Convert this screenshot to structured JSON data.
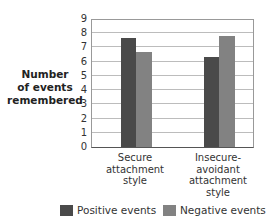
{
  "chart_data": {
    "type": "bar",
    "title": "",
    "xlabel": "",
    "ylabel": "Number of events remembered",
    "ylabel_lines": [
      "Number",
      "of events",
      "remembered"
    ],
    "ylim": [
      0,
      9
    ],
    "yticks": [
      "0",
      "1",
      "2",
      "3",
      "4",
      "5",
      "6",
      "7",
      "8",
      "9"
    ],
    "grid": true,
    "legend_position": "bottom",
    "categories": [
      "Secure attachment style",
      "Insecure-avoidant attachment style"
    ],
    "category_lines": [
      [
        "Secure",
        "attachment",
        "style"
      ],
      [
        "Insecure-",
        "avoidant",
        "attachment",
        "style"
      ]
    ],
    "series": [
      {
        "name": "Positive events",
        "color": "#4a4a4a",
        "values": [
          7.7,
          6.3
        ]
      },
      {
        "name": "Negative events",
        "color": "#828282",
        "values": [
          6.7,
          7.8
        ]
      }
    ]
  }
}
